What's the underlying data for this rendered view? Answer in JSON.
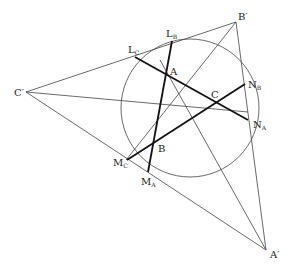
{
  "diagram": {
    "type": "geometry",
    "points": {
      "A": {
        "label": "A",
        "x": 166,
        "y": 75
      },
      "B": {
        "label": "B",
        "x": 154,
        "y": 141
      },
      "C": {
        "label": "C",
        "x": 216,
        "y": 102
      },
      "A_prime": {
        "label": "A′",
        "x": 266,
        "y": 250
      },
      "B_prime": {
        "label": "B′",
        "x": 236,
        "y": 22
      },
      "C_prime": {
        "label": "C′",
        "x": 26,
        "y": 92
      },
      "L_B": {
        "label": "L",
        "sub": "B",
        "x": 172,
        "y": 41
      },
      "L_C": {
        "label": "L",
        "sub": "C",
        "x": 135,
        "y": 57
      },
      "N_A": {
        "label": "N",
        "sub": "A",
        "x": 248,
        "y": 120
      },
      "N_B": {
        "label": "N",
        "sub": "B",
        "x": 245,
        "y": 84
      },
      "M_A": {
        "label": "M",
        "sub": "A",
        "x": 148,
        "y": 172
      },
      "M_C": {
        "label": "M",
        "sub": "C",
        "x": 127,
        "y": 160
      }
    },
    "circle": {
      "cx": 190,
      "cy": 108,
      "r": 69
    },
    "labels": {
      "A": "A",
      "B": "B",
      "C": "C",
      "A_prime": "A",
      "B_prime": "B",
      "C_prime": "C",
      "prime": "′",
      "L": "L",
      "N": "N",
      "M": "M",
      "sub_A": "A",
      "sub_B": "B",
      "sub_C": "C"
    }
  }
}
